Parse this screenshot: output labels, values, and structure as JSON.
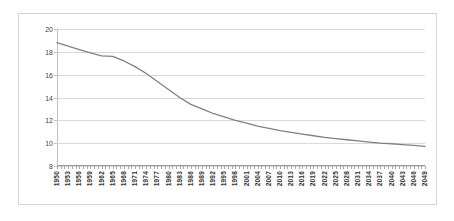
{
  "chart_data": {
    "type": "line",
    "title": "",
    "xlabel": "",
    "ylabel": "Percentage of World Population",
    "ylim": [
      8,
      20
    ],
    "yticks": [
      8,
      10,
      12,
      14,
      16,
      18,
      20
    ],
    "grid": true,
    "legend": false,
    "line_color": "#808080",
    "categories": [
      "1950",
      "1953",
      "1956",
      "1959",
      "1962",
      "1965",
      "1968",
      "1971",
      "1974",
      "1977",
      "1980",
      "1983",
      "1986",
      "1989",
      "1992",
      "1995",
      "1998",
      "2001",
      "2004",
      "2007",
      "2010",
      "2013",
      "2016",
      "2019",
      "2022",
      "2025",
      "2028",
      "2031",
      "2034",
      "2037",
      "2040",
      "2043",
      "2046",
      "2049"
    ],
    "x": [
      1950,
      1953,
      1956,
      1959,
      1962,
      1965,
      1968,
      1971,
      1974,
      1977,
      1980,
      1983,
      1986,
      1989,
      1992,
      1995,
      1998,
      2001,
      2004,
      2007,
      2010,
      2013,
      2016,
      2019,
      2022,
      2025,
      2028,
      2031,
      2034,
      2037,
      2040,
      2043,
      2046,
      2049
    ],
    "values": [
      18.8,
      18.5,
      18.2,
      17.9,
      17.65,
      17.6,
      17.2,
      16.7,
      16.1,
      15.4,
      14.7,
      14.0,
      13.4,
      13.0,
      12.6,
      12.3,
      12.0,
      11.75,
      11.5,
      11.3,
      11.1,
      10.95,
      10.8,
      10.65,
      10.5,
      10.4,
      10.3,
      10.2,
      10.1,
      10.0,
      9.95,
      9.88,
      9.8,
      9.72
    ],
    "xtick_minor_step": 1,
    "xtick_minor_range": [
      1950,
      2049
    ]
  }
}
